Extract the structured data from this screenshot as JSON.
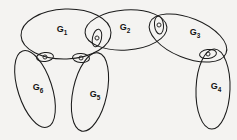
{
  "figure": {
    "background_color": "#f4f3f1",
    "ink_color": "#1b1b1b",
    "width": 237,
    "height": 140
  },
  "regions": [
    {
      "id": "g1",
      "label": "G",
      "subscript": "1",
      "label_x": 62,
      "label_y": 30,
      "cx": 66,
      "cy": 34,
      "rx": 45,
      "ry": 25,
      "rotation": -2
    },
    {
      "id": "g2",
      "label": "G",
      "subscript": "2",
      "label_x": 125,
      "label_y": 28,
      "cx": 126,
      "cy": 30,
      "rx": 41,
      "ry": 20,
      "rotation": -4
    },
    {
      "id": "g3",
      "label": "G",
      "subscript": "3",
      "label_x": 195,
      "label_y": 33,
      "cx": 188,
      "cy": 38,
      "rx": 41,
      "ry": 20,
      "rotation": 22
    },
    {
      "id": "g4",
      "label": "G",
      "subscript": "4",
      "label_x": 216,
      "label_y": 87,
      "cx": 213,
      "cy": 89,
      "rx": 17,
      "ry": 40,
      "rotation": 2
    },
    {
      "id": "g5",
      "label": "G",
      "subscript": "5",
      "label_x": 95,
      "label_y": 95,
      "cx": 90,
      "cy": 92,
      "rx": 17,
      "ry": 40,
      "rotation": 12
    },
    {
      "id": "g6",
      "label": "G",
      "subscript": "6",
      "label_x": 38,
      "label_y": 88,
      "cx": 35,
      "cy": 89,
      "rx": 17,
      "ry": 40,
      "rotation": -18
    }
  ],
  "joints": [
    {
      "id": "joint-g1-g2",
      "connects": [
        "g1",
        "g2"
      ],
      "x": 97,
      "y": 38,
      "rx": 4.5,
      "ry": 9,
      "rotation": 12,
      "dot_r": 2
    },
    {
      "id": "joint-g2-g3",
      "connects": [
        "g2",
        "g3"
      ],
      "x": 159,
      "y": 25,
      "rx": 4.5,
      "ry": 9,
      "rotation": -5,
      "dot_r": 2
    },
    {
      "id": "joint-g3-g4",
      "connects": [
        "g3",
        "g4"
      ],
      "x": 208,
      "y": 54,
      "rx": 8.5,
      "ry": 4.5,
      "rotation": -8,
      "dot_r": 2
    },
    {
      "id": "joint-g1-g5",
      "connects": [
        "g1",
        "g5"
      ],
      "x": 81,
      "y": 58,
      "rx": 8.5,
      "ry": 4.5,
      "rotation": 4,
      "dot_r": 2
    },
    {
      "id": "joint-g1-g6",
      "connects": [
        "g1",
        "g6"
      ],
      "x": 45,
      "y": 57,
      "rx": 8.5,
      "ry": 4.5,
      "rotation": -6,
      "dot_r": 2
    }
  ]
}
